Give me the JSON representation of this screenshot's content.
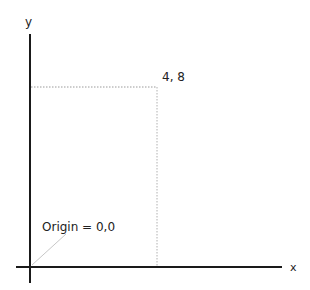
{
  "diagram": {
    "type": "coordinate-plane",
    "axes": {
      "x_label": "x",
      "y_label": "y",
      "color": "#1a1a1a"
    },
    "point": {
      "label": "4, 8",
      "x": 4,
      "y": 8
    },
    "origin": {
      "label": "Origin = 0,0"
    },
    "guide_color": "#9a9a9a",
    "pointer_color": "#c8c8c8"
  }
}
